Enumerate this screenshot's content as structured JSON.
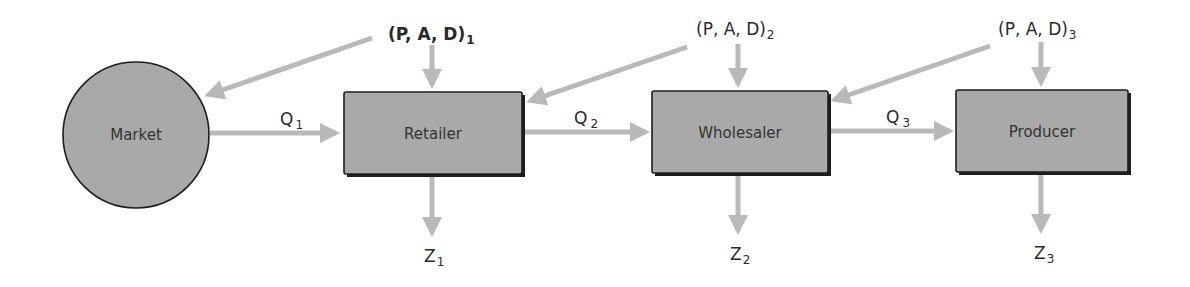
{
  "diagram": {
    "type": "flow",
    "colors": {
      "node_fill": "#a9a9a9",
      "node_border": "#1e1e1e",
      "arrow": "#b9b9b9",
      "text": "#2a2a2a",
      "background": "#ffffff"
    },
    "nodes": [
      {
        "id": "market",
        "shape": "circle",
        "label": "Market"
      },
      {
        "id": "retailer",
        "shape": "rect",
        "label": "Retailer"
      },
      {
        "id": "wholesaler",
        "shape": "rect",
        "label": "Wholesaler"
      },
      {
        "id": "producer",
        "shape": "rect",
        "label": "Producer"
      }
    ],
    "flows": [
      {
        "from": "market",
        "to": "retailer",
        "label": "Q",
        "sub": "1"
      },
      {
        "from": "retailer",
        "to": "wholesaler",
        "label": "Q",
        "sub": "2"
      },
      {
        "from": "wholesaler",
        "to": "producer",
        "label": "Q",
        "sub": "3"
      }
    ],
    "inputs": [
      {
        "label": "(P, A, D)",
        "sub": "1",
        "targets": [
          "retailer",
          "market"
        ]
      },
      {
        "label": "(P, A, D)",
        "sub": "2",
        "targets": [
          "wholesaler",
          "retailer"
        ]
      },
      {
        "label": "(P, A, D)",
        "sub": "3",
        "targets": [
          "producer",
          "wholesaler"
        ]
      }
    ],
    "outputs": [
      {
        "from": "retailer",
        "label": "Z",
        "sub": "1"
      },
      {
        "from": "wholesaler",
        "label": "Z",
        "sub": "2"
      },
      {
        "from": "producer",
        "label": "Z",
        "sub": "3"
      }
    ]
  }
}
